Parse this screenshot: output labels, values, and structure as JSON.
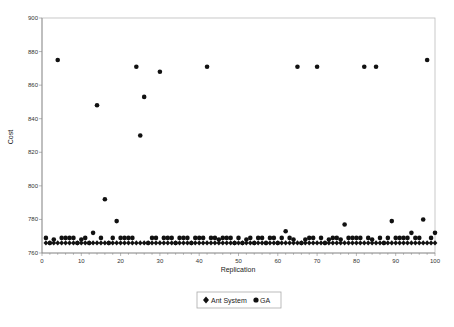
{
  "chart_data": {
    "type": "scatter",
    "title": "",
    "xlabel": "Replication",
    "ylabel": "Cost",
    "xlim": [
      0,
      100
    ],
    "ylim": [
      760,
      900
    ],
    "xticks": [
      0,
      10,
      20,
      30,
      40,
      50,
      60,
      70,
      80,
      90,
      100
    ],
    "yticks": [
      760,
      780,
      800,
      820,
      840,
      860,
      880,
      900
    ],
    "grid": false,
    "legend_position": "bottom",
    "series": [
      {
        "name": "Ant System",
        "marker": "diamond",
        "color": "#111111",
        "x": [
          1,
          2,
          3,
          4,
          5,
          6,
          7,
          8,
          9,
          10,
          11,
          12,
          13,
          14,
          15,
          16,
          17,
          18,
          19,
          20,
          21,
          22,
          23,
          24,
          25,
          26,
          27,
          28,
          29,
          30,
          31,
          32,
          33,
          34,
          35,
          36,
          37,
          38,
          39,
          40,
          41,
          42,
          43,
          44,
          45,
          46,
          47,
          48,
          49,
          50,
          51,
          52,
          53,
          54,
          55,
          56,
          57,
          58,
          59,
          60,
          61,
          62,
          63,
          64,
          65,
          66,
          67,
          68,
          69,
          70,
          71,
          72,
          73,
          74,
          75,
          76,
          77,
          78,
          79,
          80,
          81,
          82,
          83,
          84,
          85,
          86,
          87,
          88,
          89,
          90,
          91,
          92,
          93,
          94,
          95,
          96,
          97,
          98,
          99,
          100
        ],
        "y": [
          766,
          766,
          766,
          766,
          766,
          766,
          766,
          766,
          766,
          766,
          766,
          766,
          766,
          766,
          766,
          766,
          766,
          766,
          766,
          766,
          766,
          766,
          766,
          766,
          766,
          766,
          766,
          766,
          766,
          766,
          766,
          766,
          766,
          766,
          766,
          766,
          766,
          766,
          766,
          766,
          766,
          766,
          766,
          766,
          766,
          766,
          766,
          766,
          766,
          766,
          766,
          766,
          766,
          766,
          766,
          766,
          766,
          766,
          766,
          766,
          766,
          766,
          766,
          766,
          766,
          766,
          766,
          766,
          766,
          766,
          766,
          766,
          766,
          766,
          766,
          766,
          766,
          766,
          766,
          766,
          766,
          766,
          766,
          766,
          766,
          766,
          766,
          766,
          766,
          766,
          766,
          766,
          766,
          766,
          766,
          766,
          766,
          766,
          766,
          766
        ]
      },
      {
        "name": "GA",
        "marker": "circle",
        "color": "#111111",
        "x": [
          1,
          2,
          3,
          4,
          5,
          6,
          7,
          8,
          9,
          10,
          11,
          12,
          13,
          14,
          15,
          16,
          17,
          18,
          19,
          20,
          21,
          22,
          23,
          24,
          25,
          26,
          27,
          28,
          29,
          30,
          31,
          32,
          33,
          34,
          35,
          36,
          37,
          38,
          39,
          40,
          41,
          42,
          43,
          44,
          45,
          46,
          47,
          48,
          49,
          50,
          51,
          52,
          53,
          54,
          55,
          56,
          57,
          58,
          59,
          60,
          61,
          62,
          63,
          64,
          65,
          66,
          67,
          68,
          69,
          70,
          71,
          72,
          73,
          74,
          75,
          76,
          77,
          78,
          79,
          80,
          81,
          82,
          83,
          84,
          85,
          86,
          87,
          88,
          89,
          90,
          91,
          92,
          93,
          94,
          95,
          96,
          97,
          98,
          99,
          100
        ],
        "y": [
          769,
          766,
          768,
          875,
          769,
          769,
          769,
          769,
          766,
          768,
          769,
          766,
          772,
          848,
          769,
          792,
          766,
          769,
          779,
          769,
          769,
          769,
          769,
          871,
          830,
          853,
          766,
          769,
          769,
          868,
          769,
          769,
          769,
          766,
          769,
          769,
          769,
          766,
          769,
          769,
          769,
          871,
          769,
          769,
          768,
          769,
          769,
          769,
          766,
          769,
          766,
          768,
          769,
          766,
          769,
          769,
          766,
          769,
          769,
          766,
          769,
          773,
          769,
          768,
          871,
          766,
          768,
          769,
          769,
          871,
          769,
          766,
          768,
          769,
          769,
          768,
          777,
          769,
          769,
          769,
          769,
          871,
          769,
          768,
          871,
          769,
          766,
          769,
          779,
          769,
          769,
          769,
          769,
          772,
          769,
          769,
          780,
          875,
          769,
          772
        ]
      }
    ]
  },
  "legend": {
    "items": [
      {
        "label": "Ant System",
        "marker": "diamond"
      },
      {
        "label": "GA",
        "marker": "circle"
      }
    ]
  },
  "colors": {
    "axis": "#888888",
    "frame": "#bbbbbb",
    "marker": "#111111"
  }
}
